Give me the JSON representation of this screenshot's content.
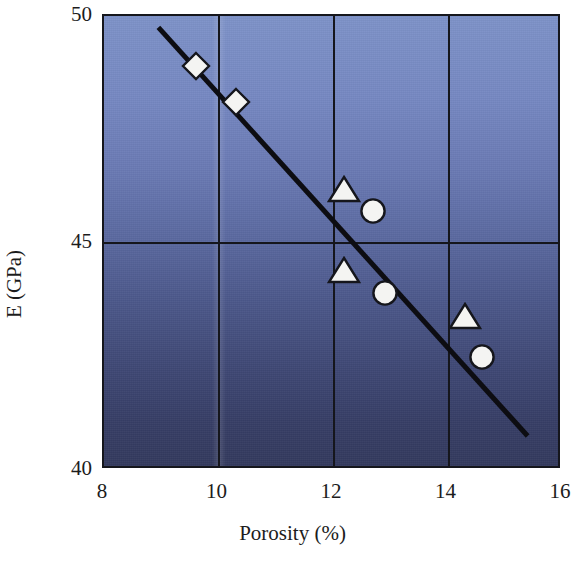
{
  "chart_data": {
    "type": "scatter",
    "title": "",
    "xlabel": "Porosity (%)",
    "ylabel": "E (GPa)",
    "xlim": [
      8,
      16
    ],
    "ylim": [
      40,
      50
    ],
    "xticks": [
      8,
      10,
      12,
      14,
      16
    ],
    "yticks": [
      40,
      45,
      50
    ],
    "xtick_labels": [
      "8",
      "10",
      "12",
      "14",
      "16"
    ],
    "ytick_labels": [
      "40",
      "45",
      "50"
    ],
    "grid": true,
    "grid_note": "Vertical gridlines at every x tick; one horizontal gridline at y = 45",
    "legend": null,
    "legend_position": "none",
    "series": [
      {
        "name": "Diamond markers",
        "marker": "diamond",
        "marker_color": "#f4f4f2",
        "marker_edge_color": "#15161c",
        "points": [
          {
            "x": 9.6,
            "y": 48.9
          },
          {
            "x": 10.3,
            "y": 48.1
          }
        ]
      },
      {
        "name": "Triangle markers",
        "marker": "triangle",
        "marker_color": "#f4f4f2",
        "marker_edge_color": "#15161c",
        "points": [
          {
            "x": 12.2,
            "y": 46.2
          },
          {
            "x": 12.2,
            "y": 44.4
          },
          {
            "x": 14.3,
            "y": 43.4
          }
        ]
      },
      {
        "name": "Circle markers",
        "marker": "circle",
        "marker_color": "#f4f4f2",
        "marker_edge_color": "#15161c",
        "points": [
          {
            "x": 12.7,
            "y": 45.7
          },
          {
            "x": 12.9,
            "y": 43.9
          },
          {
            "x": 14.6,
            "y": 42.5
          }
        ]
      }
    ],
    "trend_line": {
      "name": "Linear fit",
      "color": "#0d0d12",
      "width_px": 5,
      "x_start": 8.95,
      "y_start": 49.75,
      "x_end": 15.4,
      "y_end": 40.75,
      "slope": -1.395,
      "intercept": 62.24
    },
    "plot_background": {
      "type": "vertical-gradient",
      "top_color": "#7e92c8",
      "bottom_color": "#333a5e"
    },
    "axis_color": "#15161c",
    "text_color": "#1c1c1c"
  }
}
